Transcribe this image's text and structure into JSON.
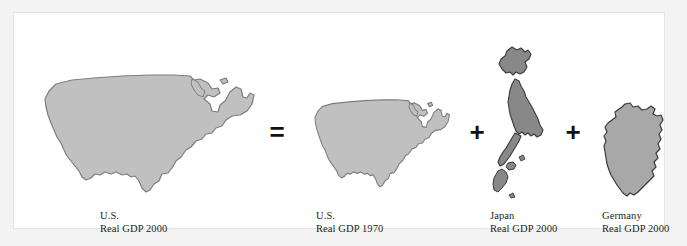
{
  "figure": {
    "equation_summary": "U.S. Real GDP 2000 = U.S. Real GDP 1970 + Japan Real GDP 2000 + Germany Real GDP 2000",
    "colors": {
      "page_background": "#f3f3f3",
      "panel_background": "#ffffff",
      "panel_border": "#e6e6e6",
      "us_map_fill": "#c0c0c0",
      "us_map_stroke": "#7d7d7d",
      "japan_map_fill": "#888888",
      "japan_map_stroke": "#3a3a3a",
      "germany_map_fill": "#a8a8a8",
      "germany_map_stroke": "#3a3a3a",
      "operator_color": "#111111",
      "caption_color": "#231f20"
    },
    "items": [
      {
        "icon": "united-states-map-icon",
        "country": "U.S.",
        "measure": "Real GDP 2000",
        "size": "large"
      },
      {
        "icon": "united-states-map-icon",
        "country": "U.S.",
        "measure": "Real GDP 1970",
        "size": "medium"
      },
      {
        "icon": "japan-map-icon",
        "country": "Japan",
        "measure": "Real GDP 2000",
        "size": "small"
      },
      {
        "icon": "germany-map-icon",
        "country": "Germany",
        "measure": "Real GDP 2000",
        "size": "small"
      }
    ],
    "operators": {
      "equals": "=",
      "plus_first": "+",
      "plus_second": "+"
    }
  }
}
